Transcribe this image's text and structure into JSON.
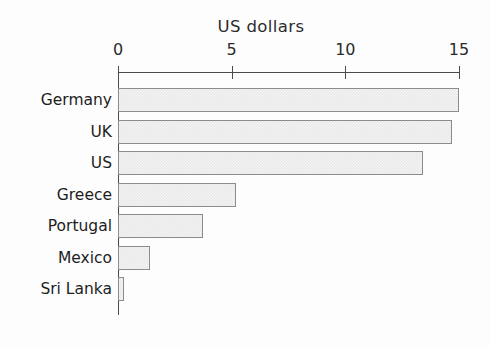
{
  "chart_data": {
    "type": "bar",
    "orientation": "horizontal",
    "title": "US dollars",
    "xlabel": "US dollars",
    "ylabel": "",
    "categories": [
      "Germany",
      "UK",
      "US",
      "Greece",
      "Portugal",
      "Mexico",
      "Sri Lanka"
    ],
    "values": [
      15.0,
      14.7,
      13.4,
      5.2,
      3.75,
      1.4,
      0.25
    ],
    "xlim": [
      0,
      15
    ],
    "xticks": [
      0,
      5,
      10,
      15
    ],
    "xtick_labels": [
      "0",
      "5",
      "10",
      "15"
    ],
    "grid": false,
    "legend": null,
    "bar_fill_color": "#e9e9e9",
    "bar_edge_color": "#8c8c8c",
    "axis_color": "#4a4a4a",
    "background_color": "#fdfdfd"
  }
}
